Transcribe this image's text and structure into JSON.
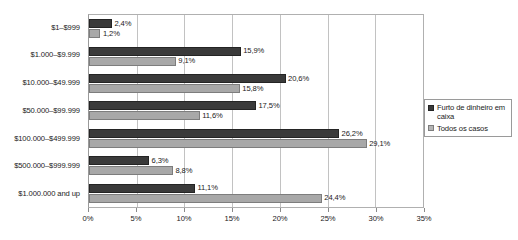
{
  "chart_data": {
    "type": "bar",
    "orientation": "horizontal",
    "title": "",
    "subtitle": "",
    "xlabel": "",
    "ylabel": "",
    "xlim": [
      0,
      35
    ],
    "xticks": [
      "0%",
      "5%",
      "10%",
      "15%",
      "20%",
      "25%",
      "30%",
      "35%"
    ],
    "xtick_values": [
      0,
      5,
      10,
      15,
      20,
      25,
      30,
      35
    ],
    "grid": true,
    "legend_position": "right",
    "categories": [
      "$1–$999",
      "$1.000–$9.999",
      "$10.000–$49.999",
      "$50.000–$99.999",
      "$100.000–$499.999",
      "$500.000–$999.999",
      "$1.000.000 and up"
    ],
    "series": [
      {
        "name": "Furto de dinheiro em caixa",
        "color": "#3a3a3a",
        "values": [
          2.4,
          15.9,
          20.6,
          17.5,
          26.2,
          6.3,
          11.1
        ],
        "labels": [
          "2,4%",
          "15,9%",
          "20,6%",
          "17,5%",
          "26,2%",
          "6,3%",
          "11,1%"
        ]
      },
      {
        "name": "Todos os casos",
        "color": "#a8a8a8",
        "values": [
          1.2,
          9.1,
          15.8,
          11.6,
          29.1,
          8.8,
          24.4
        ],
        "labels": [
          "1,2%",
          "9,1%",
          "15,8%",
          "11,6%",
          "29,1%",
          "8,8%",
          "24,4%"
        ]
      }
    ]
  },
  "legend": {
    "entries": [
      {
        "label": "Furto de dinheiro em caixa",
        "swatch": "dark-square-icon"
      },
      {
        "label": "Todos os casos",
        "swatch": "light-square-icon"
      }
    ]
  }
}
